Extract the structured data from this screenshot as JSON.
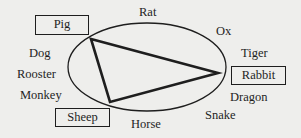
{
  "diagram": {
    "type": "zodiac-circle-triangle",
    "colors": {
      "ink": "#1e1e1e",
      "background": "#eeeeec"
    },
    "labels": {
      "rat": "Rat",
      "ox": "Ox",
      "tiger": "Tiger",
      "rabbit": "Rabbit",
      "dragon": "Dragon",
      "snake": "Snake",
      "horse": "Horse",
      "sheep": "Sheep",
      "monkey": "Monkey",
      "rooster": "Rooster",
      "dog": "Dog",
      "pig": "Pig"
    },
    "highlighted": [
      "Pig",
      "Rabbit",
      "Sheep"
    ],
    "triangle_vertices": [
      "Pig",
      "Rabbit",
      "Sheep"
    ]
  }
}
